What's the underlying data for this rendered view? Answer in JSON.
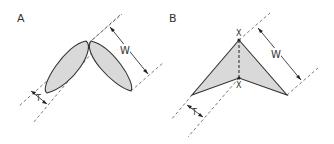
{
  "figure": {
    "panels": [
      {
        "id": "A",
        "label": "A",
        "shape": "two lens-shaped (ellipse) elements in V arrangement",
        "dimensions": {
          "width_label": "W",
          "thickness_label": "T"
        }
      },
      {
        "id": "B",
        "label": "B",
        "shape": "chevron/arrowhead polygon with dashed center line",
        "points": {
          "top_label": "X",
          "bottom_label": "X"
        },
        "dimensions": {
          "width_label": "W",
          "thickness_label": "T"
        }
      }
    ],
    "colors": {
      "fill": "#d9d9d9",
      "stroke": "#333333",
      "background": "#ffffff"
    }
  }
}
